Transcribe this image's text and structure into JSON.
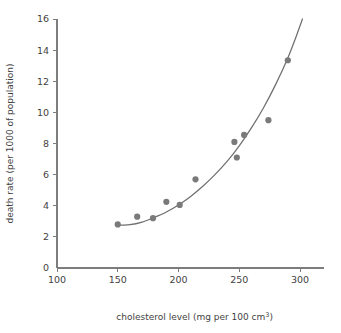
{
  "chart_data": {
    "type": "scatter",
    "title": "",
    "subtitle": "",
    "xlabel": "cholesterol level (mg per 100 cm3)",
    "xlabel_base": "cholesterol level (mg per 100 cm",
    "xlabel_sup": "3",
    "xlabel_tail": ")",
    "ylabel": "death rate (per 1000 of population)",
    "xlim": [
      100,
      320
    ],
    "ylim": [
      0,
      16
    ],
    "xticks": [
      100,
      150,
      200,
      250,
      300
    ],
    "yticks": [
      0,
      2,
      4,
      6,
      8,
      10,
      12,
      14,
      16
    ],
    "xtick_labels": [
      "100",
      "150",
      "200",
      "250",
      "300"
    ],
    "ytick_labels": [
      "0",
      "2",
      "4",
      "6",
      "8",
      "10",
      "12",
      "14",
      "16"
    ],
    "grid": false,
    "legend": false,
    "legend_position": "none",
    "point_color": "#7a7a7a",
    "curve_color": "#6f6f6f",
    "axis_color": "#7d7d7d",
    "background_color": "#ffffff",
    "series": [
      {
        "name": "observations",
        "marker": "filled-circle",
        "points": [
          {
            "x": 150,
            "y": 2.8
          },
          {
            "x": 166,
            "y": 3.3
          },
          {
            "x": 179,
            "y": 3.2
          },
          {
            "x": 190,
            "y": 4.25
          },
          {
            "x": 201,
            "y": 4.05
          },
          {
            "x": 214,
            "y": 5.7
          },
          {
            "x": 246,
            "y": 8.1
          },
          {
            "x": 248,
            "y": 7.1
          },
          {
            "x": 254,
            "y": 8.55
          },
          {
            "x": 274,
            "y": 9.5
          },
          {
            "x": 290,
            "y": 13.35
          }
        ]
      },
      {
        "name": "fitted-curve",
        "marker": "none",
        "points": [
          {
            "x": 150,
            "y": 2.75
          },
          {
            "x": 160,
            "y": 2.78
          },
          {
            "x": 170,
            "y": 2.95
          },
          {
            "x": 180,
            "y": 3.25
          },
          {
            "x": 190,
            "y": 3.6
          },
          {
            "x": 200,
            "y": 4.05
          },
          {
            "x": 210,
            "y": 4.6
          },
          {
            "x": 220,
            "y": 5.25
          },
          {
            "x": 230,
            "y": 6.0
          },
          {
            "x": 240,
            "y": 6.85
          },
          {
            "x": 250,
            "y": 7.85
          },
          {
            "x": 260,
            "y": 9.0
          },
          {
            "x": 270,
            "y": 10.3
          },
          {
            "x": 280,
            "y": 11.8
          },
          {
            "x": 290,
            "y": 13.5
          },
          {
            "x": 296,
            "y": 14.7
          },
          {
            "x": 302,
            "y": 16.0
          }
        ]
      }
    ]
  }
}
